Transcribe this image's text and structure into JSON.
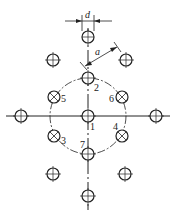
{
  "diagram": {
    "dimension_labels": {
      "diameter": "d",
      "spacing": "a"
    },
    "hole_labels": [
      "1",
      "2",
      "3",
      "4",
      "5",
      "6",
      "7"
    ],
    "colors": {
      "line": "#222222",
      "background": "#ffffff"
    }
  }
}
